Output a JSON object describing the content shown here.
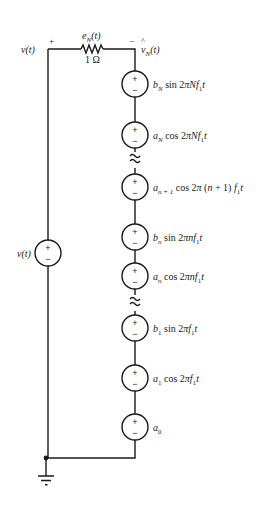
{
  "diagram": {
    "type": "circuit",
    "node_left": {
      "label": "v(t)",
      "polarity": "+"
    },
    "node_right": {
      "label": "v̂_N(t)",
      "polarity": "−"
    },
    "resistor": {
      "value": "1 Ω",
      "current_label": "e_N(t)"
    },
    "left_source": {
      "label": "v(t)",
      "plus": "+",
      "minus": "−"
    },
    "sources": [
      {
        "id": "bN",
        "coef": "b",
        "sub": "N",
        "func": "sin 2πNf",
        "sub2": "1",
        "tail": "t"
      },
      {
        "id": "aN",
        "coef": "a",
        "sub": "N",
        "func": "cos 2πNf",
        "sub2": "1",
        "tail": "t"
      },
      {
        "id": "an1",
        "coef": "a",
        "sub": "n + 1",
        "func": "cos 2π (n + 1) f",
        "sub2": "1",
        "tail": "t"
      },
      {
        "id": "bn",
        "coef": "b",
        "sub": "n",
        "func": "sin 2πnf",
        "sub2": "1",
        "tail": "t"
      },
      {
        "id": "an",
        "coef": "a",
        "sub": "n",
        "func": "cos 2πnf",
        "sub2": "1",
        "tail": "t"
      },
      {
        "id": "b1",
        "coef": "b",
        "sub": "1",
        "func": "sin 2πf",
        "sub2": "1",
        "tail": "t"
      },
      {
        "id": "a1",
        "coef": "a",
        "sub": "1",
        "func": "cos 2πf",
        "sub2": "1",
        "tail": "t"
      },
      {
        "id": "a0",
        "coef": "a",
        "sub": "0",
        "func": "",
        "sub2": "",
        "tail": ""
      }
    ],
    "plus": "+",
    "minus": "−",
    "ground": "ground"
  }
}
